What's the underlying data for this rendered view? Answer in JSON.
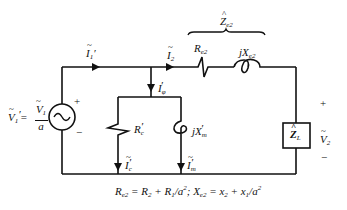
{
  "diagram": {
    "type": "circuit",
    "source": {
      "label": "V1' = V1 / a",
      "lhs": "V",
      "lhs_sub": "1",
      "numerator": "V",
      "numerator_sub": "1",
      "denominator": "a",
      "plus": "+",
      "minus": "−",
      "symbol": "~"
    },
    "currents": {
      "i1": {
        "base": "I",
        "sub": "1",
        "prime": "′"
      },
      "i2": {
        "base": "I",
        "sub": "2"
      },
      "iphi": {
        "base": "I",
        "sub": "φ",
        "prime": "′"
      },
      "ic": {
        "base": "I",
        "sub": "c",
        "prime": "′"
      },
      "im": {
        "base": "I",
        "sub": "m",
        "prime": "′"
      }
    },
    "components": {
      "rc": {
        "base": "R",
        "sub": "c",
        "prime": "′"
      },
      "xm": {
        "prefix": "j",
        "base": "X",
        "sub": "m",
        "prime": "′"
      },
      "re2": {
        "base": "R",
        "sub": "e2"
      },
      "xe2": {
        "prefix": "j",
        "base": "X",
        "sub": "e2"
      },
      "ze2": {
        "base": "Z",
        "sub": "e2",
        "hat": "^"
      },
      "zl": {
        "base": "Z",
        "sub": "L",
        "hat": "^"
      }
    },
    "output_voltage": {
      "base": "V",
      "sub": "2",
      "plus": "+",
      "minus": "−"
    },
    "equation": "Re2 = R2 + R1/a²;  Xe2 = x2 + x1/a²",
    "equation_parts": {
      "p1": "R",
      "p1_sub": "e2",
      "p2": " = R",
      "p2_sub": "2",
      "p3": " + R",
      "p3_sub": "1",
      "p4": "/a",
      "p4_sup": "2",
      "p5": "; X",
      "p5_sub": "e2",
      "p6": " = x",
      "p6_sub": "2",
      "p7": " + x",
      "p7_sub": "1",
      "p8": "/a",
      "p8_sup": "2"
    }
  }
}
